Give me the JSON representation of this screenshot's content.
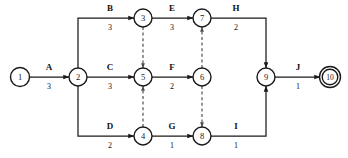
{
  "diagram": {
    "background_color": "#ffffff",
    "line_color": "#1a1a1a",
    "dashed_color": "#4a4a4a",
    "nodes": [
      {
        "id": "1",
        "label": "1",
        "x": 20,
        "y": 77,
        "r": 9.5,
        "double": false
      },
      {
        "id": "2",
        "label": "2",
        "x": 78,
        "y": 77,
        "r": 9.0,
        "double": false
      },
      {
        "id": "3",
        "label": "3",
        "x": 143,
        "y": 18,
        "r": 9.0,
        "double": false
      },
      {
        "id": "4",
        "label": "4",
        "x": 143,
        "y": 136,
        "r": 9.0,
        "double": false
      },
      {
        "id": "5",
        "label": "5",
        "x": 143,
        "y": 77,
        "r": 9.0,
        "double": false
      },
      {
        "id": "6",
        "label": "6",
        "x": 202,
        "y": 77,
        "r": 9.0,
        "double": false
      },
      {
        "id": "7",
        "label": "7",
        "x": 202,
        "y": 18,
        "r": 9.0,
        "double": false
      },
      {
        "id": "8",
        "label": "8",
        "x": 202,
        "y": 136,
        "r": 9.0,
        "double": false
      },
      {
        "id": "9",
        "label": "9",
        "x": 266,
        "y": 77,
        "r": 9.0,
        "double": false
      },
      {
        "id": "10",
        "label": "10",
        "x": 330,
        "y": 77,
        "r": 8.0,
        "double": true
      }
    ],
    "activities": [
      {
        "id": "A",
        "name": "A",
        "duration": "3",
        "from": "1",
        "to": "2",
        "label_x": 49,
        "name_y": 70,
        "dur_y": 88
      },
      {
        "id": "B",
        "name": "B",
        "duration": "3",
        "from": "2",
        "to": "3",
        "label_x": 110,
        "name_y": 11,
        "dur_y": 29
      },
      {
        "id": "C",
        "name": "C",
        "duration": "3",
        "from": "2",
        "to": "5",
        "label_x": 110,
        "name_y": 70,
        "dur_y": 88
      },
      {
        "id": "D",
        "name": "D",
        "duration": "2",
        "from": "2",
        "to": "4",
        "label_x": 110,
        "name_y": 129,
        "dur_y": 147
      },
      {
        "id": "E",
        "name": "E",
        "duration": "3",
        "from": "3",
        "to": "7",
        "label_x": 172,
        "name_y": 11,
        "dur_y": 29
      },
      {
        "id": "F",
        "name": "F",
        "duration": "2",
        "from": "5",
        "to": "6",
        "label_x": 172,
        "name_y": 70,
        "dur_y": 88
      },
      {
        "id": "G",
        "name": "G",
        "duration": "1",
        "from": "4",
        "to": "8",
        "label_x": 172,
        "name_y": 129,
        "dur_y": 147
      },
      {
        "id": "H",
        "name": "H",
        "duration": "2",
        "from": "7",
        "to": "9",
        "label_x": 236,
        "name_y": 11,
        "dur_y": 29
      },
      {
        "id": "I",
        "name": "I",
        "duration": "1",
        "from": "8",
        "to": "9",
        "label_x": 236,
        "name_y": 129,
        "dur_y": 147
      },
      {
        "id": "J",
        "name": "J",
        "duration": "1",
        "from": "9",
        "to": "10",
        "label_x": 298,
        "name_y": 70,
        "dur_y": 88
      }
    ],
    "dummy_activities": [
      {
        "id": "d1",
        "from": "3",
        "to": "5"
      },
      {
        "id": "d2",
        "from": "4",
        "to": "5"
      },
      {
        "id": "d3",
        "from": "6",
        "to": "7"
      },
      {
        "id": "d4",
        "from": "6",
        "to": "8"
      }
    ]
  }
}
